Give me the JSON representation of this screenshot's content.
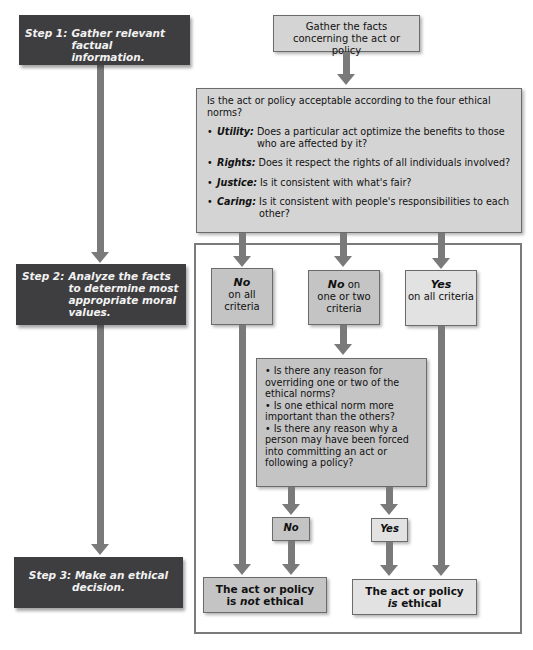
{
  "steps": [
    {
      "label": "Step 1:",
      "text": "Gather relevant factual information."
    },
    {
      "label": "Step 2:",
      "text": "Analyze the facts to determine most appropriate moral values."
    },
    {
      "label": "Step 3:",
      "text": "Make an ethical decision."
    }
  ],
  "gather_box": {
    "text": "Gather the facts concerning the act or policy"
  },
  "norms_box": {
    "question": "Is the act or policy acceptable according to the four ethical norms?",
    "bullet": "•",
    "items": [
      {
        "term": "Utility:",
        "desc": "Does a particular act optimize the benefits to those who are affected by it?"
      },
      {
        "term": "Rights:",
        "desc": "Does it respect the rights of all individuals involved?"
      },
      {
        "term": "Justice:",
        "desc": "Is it consistent with what's fair?"
      },
      {
        "term": "Caring:",
        "desc": "Is it consistent with people's responsibilities to each other?"
      }
    ]
  },
  "criteria": [
    {
      "emph": "No",
      "rest_inline": "",
      "rest": "on all criteria"
    },
    {
      "emph": "No",
      "rest_inline": " on",
      "rest": "one or two criteria"
    },
    {
      "emph": "Yes",
      "rest_inline": "",
      "rest": "on all criteria"
    }
  ],
  "questions_box": {
    "items": [
      "• Is there any reason for overriding one or two of the ethical norms?",
      "• Is one ethical norm more important than the others?",
      "• Is there any reason why a person may have been forced into committing an act or following a policy?"
    ]
  },
  "answers": {
    "no": "No",
    "yes": "Yes"
  },
  "results": {
    "not_ethical": {
      "line1": "The act or policy",
      "pre": "is ",
      "emph": "not",
      "post": " ethical"
    },
    "ethical": {
      "line1": "The act or policy",
      "pre": "",
      "emph": "is",
      "post": " ethical"
    }
  },
  "colors": {
    "step_box": "#3e3e40",
    "arrow": "#7a7a7a",
    "box_fill": "#d4d4d4",
    "box_border": "#6b6b6b"
  }
}
